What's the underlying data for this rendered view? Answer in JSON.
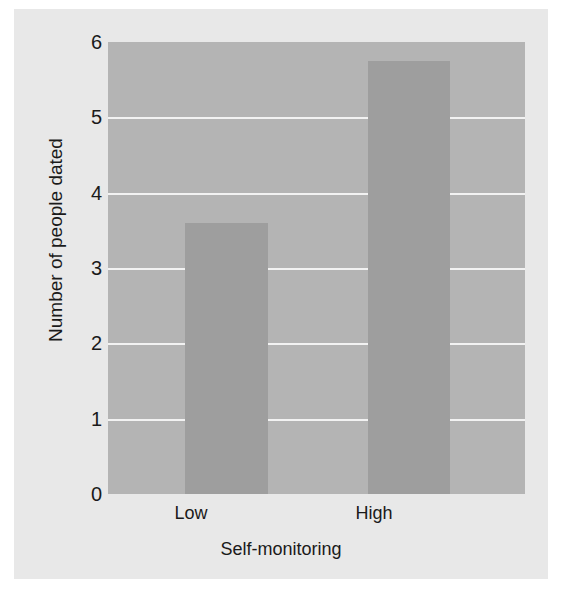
{
  "chart_data": {
    "type": "bar",
    "title": "",
    "subtitle": "",
    "xlabel": "Self-monitoring",
    "ylabel": "Number of people dated",
    "categories": [
      "Low",
      "High"
    ],
    "values": [
      3.6,
      5.75
    ],
    "series": [
      {
        "name": "Number of people dated",
        "values": [
          3.6,
          5.75
        ]
      }
    ],
    "ylim": [
      0,
      6
    ],
    "yticks": [
      0,
      1,
      2,
      3,
      4,
      5,
      6
    ],
    "ytick_labels": [
      "0",
      "1",
      "2",
      "3",
      "4",
      "5",
      "6"
    ],
    "grid": true,
    "grid_axis": "y",
    "legend": false,
    "legend_position": "none",
    "annotations": []
  },
  "style": {
    "page_background": "#ffffff",
    "figure_background": "#e8e8e8",
    "plot_background": "#b4b4b4",
    "bar_color": "#9e9e9e",
    "gridline_color": "#f2f2f2",
    "text_color": "#1a1a1a"
  }
}
